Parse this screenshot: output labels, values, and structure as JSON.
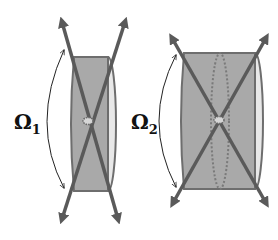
{
  "figure": {
    "panels": [
      {
        "id": "panel-1",
        "label_symbol": "Ω",
        "label_subscript": "1",
        "description": "Narrow cylinder with crossing arrows (solid angle Ω1)"
      },
      {
        "id": "panel-2",
        "label_symbol": "Ω",
        "label_subscript": "2",
        "description": "Wide cylinder with crossing arrows and dotted inner ellipse (solid angle Ω2)"
      }
    ],
    "colors": {
      "cylinder_fill": "#a9a9a9",
      "cylinder_edge": "#6e6e6e",
      "end_cap_fill": "#e8e8e8",
      "arrow": "#5a5a5a",
      "angle_arc": "#222222",
      "dotted": "#7a7a7a"
    }
  }
}
